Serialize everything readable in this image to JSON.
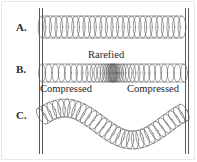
{
  "figure": {
    "background_color": "#ffffff",
    "ink_color": "#5e5e5e",
    "text_color": "#1f1f1f",
    "width": 197,
    "height": 162
  },
  "walls": {
    "left_label": "left-support-wall",
    "right_label": "right-support-wall",
    "color": "#5b5b5b"
  },
  "rows": [
    {
      "id": "a",
      "label": "A.",
      "description": "Slinky at rest with evenly spaced coils",
      "state": "undisturbed"
    },
    {
      "id": "b",
      "label": "B.",
      "description": "Longitudinal wave: coils bunched at both ends, spread apart in the middle",
      "state": "longitudinal"
    },
    {
      "id": "c",
      "label": "C.",
      "description": "Transverse wave: coils follow an up-down wave path",
      "state": "transverse"
    }
  ],
  "annotations": [
    {
      "id": "rarefied",
      "text": "Rarefied"
    },
    {
      "id": "compressed-left",
      "text": "Compressed"
    },
    {
      "id": "compressed-right",
      "text": "Compressed"
    }
  ],
  "chart_data": {
    "type": "diagram",
    "rows": [
      {
        "label": "A.",
        "kind": "rest",
        "coil_count": 26,
        "x_start": 42,
        "x_end": 182,
        "y_center": 27,
        "coil_ry": 11,
        "spacing": "uniform"
      },
      {
        "label": "B.",
        "kind": "longitudinal",
        "coil_count": 40,
        "x_start": 42,
        "x_end": 184,
        "y_center": 73,
        "coil_ry": 9,
        "spacing": "dense-sparse-dense",
        "labels": [
          "Compressed",
          "Rarefied",
          "Compressed"
        ]
      },
      {
        "label": "C.",
        "kind": "transverse",
        "coil_count": 30,
        "x_start": 42,
        "x_end": 184,
        "y_center": 124,
        "amplitude": 16,
        "coil_ry": 9,
        "spacing": "uniform-along-path"
      }
    ]
  }
}
